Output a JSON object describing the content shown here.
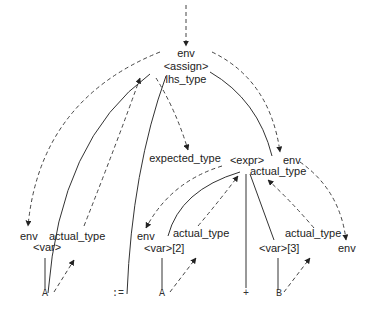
{
  "diagram": {
    "type": "attribute-grammar parse tree",
    "root": {
      "inherited_label": "env",
      "node_label": "<assign>",
      "synthesized_label": "lhs_type"
    },
    "expected_type_label": "expected_type",
    "expr": {
      "node_label": "<expr>",
      "inherited_label": "env",
      "synthesized_label": "actual_type"
    },
    "var1": {
      "inherited_label": "env",
      "node_label": "<var>",
      "synthesized_label": "actual_type"
    },
    "var2": {
      "inherited_label": "env",
      "node_label": "<var>[2]",
      "synthesized_label": "actual_type"
    },
    "var3": {
      "node_label": "<var>[3]",
      "synthesized_label": "actual_type",
      "inherited_label": "env"
    },
    "terminals": [
      "A",
      ":=",
      "A",
      "+",
      "B"
    ]
  }
}
